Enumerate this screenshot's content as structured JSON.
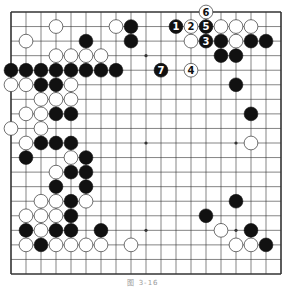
{
  "diagram": {
    "type": "go-board",
    "size": 19,
    "caption": "图 3-16",
    "colors": {
      "background": "#ffffff",
      "line": "#333333",
      "black": "#111111",
      "white": "#ffffff",
      "stone_outline": "#333333"
    },
    "geometry": {
      "left": 11,
      "top": 12,
      "right": 281,
      "bottom": 274
    },
    "star_points": [
      [
        3,
        3
      ],
      [
        9,
        3
      ],
      [
        15,
        3
      ],
      [
        3,
        9
      ],
      [
        9,
        9
      ],
      [
        15,
        9
      ],
      [
        3,
        15
      ],
      [
        9,
        15
      ],
      [
        15,
        15
      ]
    ],
    "black_stones": [
      [
        8,
        1
      ],
      [
        8,
        2
      ],
      [
        5,
        2
      ],
      [
        14,
        2
      ],
      [
        16,
        2
      ],
      [
        17,
        2
      ],
      [
        14,
        3
      ],
      [
        15,
        3
      ],
      [
        15,
        5
      ],
      [
        16,
        7
      ],
      [
        0,
        4
      ],
      [
        1,
        4
      ],
      [
        2,
        4
      ],
      [
        3,
        4
      ],
      [
        4,
        4
      ],
      [
        5,
        4
      ],
      [
        6,
        4
      ],
      [
        7,
        4
      ],
      [
        2,
        5
      ],
      [
        3,
        5
      ],
      [
        3,
        7
      ],
      [
        4,
        7
      ],
      [
        2,
        9
      ],
      [
        3,
        9
      ],
      [
        4,
        9
      ],
      [
        1,
        10
      ],
      [
        5,
        10
      ],
      [
        4,
        11
      ],
      [
        5,
        11
      ],
      [
        3,
        12
      ],
      [
        5,
        12
      ],
      [
        4,
        13
      ],
      [
        4,
        14
      ],
      [
        1,
        15
      ],
      [
        3,
        15
      ],
      [
        4,
        15
      ],
      [
        6,
        15
      ],
      [
        2,
        16
      ],
      [
        15,
        13
      ],
      [
        13,
        14
      ],
      [
        16,
        15
      ],
      [
        17,
        16
      ]
    ],
    "white_stones": [
      [
        3,
        1
      ],
      [
        7,
        1
      ],
      [
        14,
        1
      ],
      [
        15,
        1
      ],
      [
        16,
        1
      ],
      [
        1,
        2
      ],
      [
        12,
        2
      ],
      [
        15,
        2
      ],
      [
        3,
        3
      ],
      [
        4,
        3
      ],
      [
        5,
        3
      ],
      [
        6,
        3
      ],
      [
        0,
        5
      ],
      [
        1,
        5
      ],
      [
        4,
        5
      ],
      [
        2,
        6
      ],
      [
        3,
        6
      ],
      [
        4,
        6
      ],
      [
        1,
        7
      ],
      [
        2,
        7
      ],
      [
        0,
        8
      ],
      [
        2,
        8
      ],
      [
        1,
        9
      ],
      [
        4,
        10
      ],
      [
        3,
        11
      ],
      [
        2,
        13
      ],
      [
        3,
        13
      ],
      [
        5,
        13
      ],
      [
        1,
        14
      ],
      [
        2,
        14
      ],
      [
        3,
        14
      ],
      [
        2,
        15
      ],
      [
        1,
        16
      ],
      [
        3,
        16
      ],
      [
        4,
        16
      ],
      [
        5,
        16
      ],
      [
        6,
        16
      ],
      [
        8,
        16
      ],
      [
        16,
        9
      ],
      [
        14,
        15
      ],
      [
        15,
        16
      ],
      [
        16,
        16
      ]
    ],
    "numbered_moves": [
      {
        "n": "1",
        "color": "black",
        "col": 11,
        "row": 1
      },
      {
        "n": "2",
        "color": "white",
        "col": 12,
        "row": 1
      },
      {
        "n": "3",
        "color": "black",
        "col": 13,
        "row": 2
      },
      {
        "n": "4",
        "color": "white",
        "col": 12,
        "row": 4
      },
      {
        "n": "5",
        "color": "black",
        "col": 13,
        "row": 1
      },
      {
        "n": "6",
        "color": "white",
        "col": 13,
        "row": 0
      },
      {
        "n": "7",
        "color": "black",
        "col": 10,
        "row": 4
      }
    ]
  }
}
